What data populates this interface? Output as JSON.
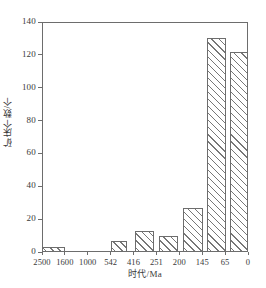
{
  "chart_data": {
    "type": "bar",
    "title": "",
    "subtitle": "",
    "xlabel": "时代/Ma",
    "ylabel": "矿床个数/个",
    "xlim": [
      2500,
      0
    ],
    "ylim": [
      0,
      140
    ],
    "grid": false,
    "legend": "none",
    "x_tick_labels": [
      "2500",
      "1600",
      "1000",
      "542",
      "416",
      "251",
      "200",
      "145",
      "65",
      "0"
    ],
    "y_tick_labels": [
      "0",
      "20",
      "40",
      "60",
      "80",
      "100",
      "120",
      "140"
    ],
    "y_ticks": [
      0,
      20,
      40,
      60,
      80,
      100,
      120,
      140
    ],
    "categories": [
      "2500-1600",
      "1600-1000",
      "1000-542",
      "542-416",
      "416-251",
      "251-200",
      "200-145",
      "145-65",
      "65-0"
    ],
    "values": [
      3,
      0,
      0,
      7,
      13,
      10,
      27,
      130,
      122
    ],
    "bar_style": {
      "fill": "#ffffff",
      "hatch": "diagonal-lines",
      "edge": "#6d6d6d"
    },
    "bars": [
      {
        "label": "2500-1600",
        "value": 3,
        "left_pct": 0.0,
        "width_pct": 11.0
      },
      {
        "label": "1600-1000",
        "value": 0,
        "left_pct": 11.0,
        "width_pct": 11.0
      },
      {
        "label": "1000-542",
        "value": 0,
        "left_pct": 22.0,
        "width_pct": 11.0
      },
      {
        "label": "542-416",
        "value": 7,
        "left_pct": 33.5,
        "width_pct": 8.0
      },
      {
        "label": "416-251",
        "value": 13,
        "left_pct": 45.0,
        "width_pct": 9.5
      },
      {
        "label": "251-200",
        "value": 10,
        "left_pct": 57.0,
        "width_pct": 9.0
      },
      {
        "label": "200-145",
        "value": 27,
        "left_pct": 68.5,
        "width_pct": 9.5
      },
      {
        "label": "145-65",
        "value": 130,
        "left_pct": 80.0,
        "width_pct": 9.5
      },
      {
        "label": "65-0",
        "value": 122,
        "left_pct": 91.5,
        "width_pct": 8.5
      }
    ]
  },
  "axes": {
    "y_title": "矿床个数/个",
    "x_title": "时代/Ma"
  }
}
